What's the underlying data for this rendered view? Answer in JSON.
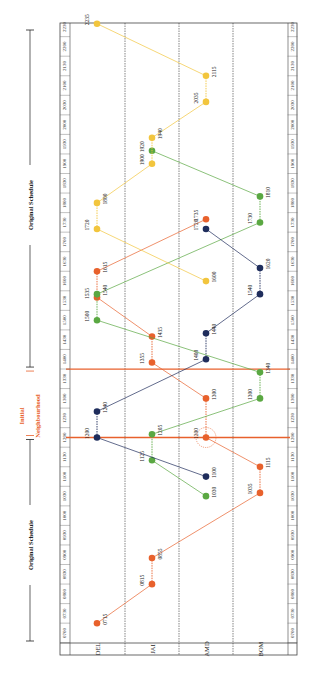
{
  "chart_data": {
    "type": "line",
    "orientation": "rotated 90° counter-clockwise; time axis runs bottom (0700) to top (2230)",
    "time_ticks": [
      "0700",
      "0730",
      "0800",
      "0830",
      "0900",
      "0930",
      "1000",
      "1030",
      "1100",
      "1130",
      "1200",
      "1230",
      "1300",
      "1330",
      "1400",
      "1430",
      "1500",
      "1530",
      "1600",
      "1630",
      "1700",
      "1730",
      "1800",
      "1830",
      "1900",
      "1930",
      "2000",
      "2030",
      "2100",
      "2130",
      "2200",
      "2230"
    ],
    "stations": [
      "DEL",
      "JAI",
      "AMD",
      "BOM"
    ],
    "annotations": {
      "original_schedule_top": "Original Schedule",
      "original_schedule_bottom": "Original Schedule",
      "neighbourhood_line1": "Initial",
      "neighbourhood_line2": "Neighbourhood",
      "neighbourhood_range": [
        "1200",
        "1345"
      ],
      "highlight_circle_at": {
        "station": "AMD",
        "time": "1200"
      }
    },
    "series": [
      {
        "name": "Train 1 (red, DEL→BOM)",
        "color": "#e8612c",
        "points": [
          {
            "station": "DEL",
            "time": "0715",
            "label": "0715"
          },
          {
            "station": "JAI",
            "time": "0815",
            "label": "0815"
          },
          {
            "station": "JAI",
            "time": "0855",
            "label": "0855"
          },
          {
            "station": "BOM",
            "time": "1035",
            "label": "1035"
          },
          {
            "station": "BOM",
            "time": "1115",
            "label": "1115"
          },
          {
            "station": "AMD",
            "time": "1200",
            "label": "1200"
          },
          {
            "station": "AMD",
            "time": "1300",
            "label": "1300"
          },
          {
            "station": "JAI",
            "time": "1355",
            "label": "1355"
          },
          {
            "station": "JAI",
            "time": "1435",
            "label": "1435"
          },
          {
            "station": "DEL",
            "time": "1535",
            "label": "1535"
          },
          {
            "station": "DEL",
            "time": "1615",
            "label": "1615"
          },
          {
            "station": "AMD",
            "time": "1735",
            "label": "1735"
          }
        ]
      },
      {
        "name": "Train 2 (green)",
        "color": "#5aa842",
        "points": [
          {
            "station": "AMD",
            "time": "1030",
            "label": "1030"
          },
          {
            "station": "JAI",
            "time": "1125",
            "label": "1125"
          },
          {
            "station": "JAI",
            "time": "1205",
            "label": "1205"
          },
          {
            "station": "BOM",
            "time": "1300",
            "label": "1300"
          },
          {
            "station": "BOM",
            "time": "1340",
            "label": "1340"
          },
          {
            "station": "DEL",
            "time": "1500",
            "label": "1500"
          },
          {
            "station": "DEL",
            "time": "1540",
            "label": "1540"
          },
          {
            "station": "BOM",
            "time": "1730",
            "label": "1730"
          },
          {
            "station": "BOM",
            "time": "1810",
            "label": "1810"
          },
          {
            "station": "JAI",
            "time": "1920",
            "label": "1920"
          }
        ]
      },
      {
        "name": "Train 3 (navy)",
        "color": "#1f2d5c",
        "points": [
          {
            "station": "AMD",
            "time": "1100",
            "label": "1100"
          },
          {
            "station": "DEL",
            "time": "1200",
            "label": "1200"
          },
          {
            "station": "DEL",
            "time": "1240",
            "label": "1240"
          },
          {
            "station": "AMD",
            "time": "1400",
            "label": "1400"
          },
          {
            "station": "AMD",
            "time": "1440",
            "label": "1440"
          },
          {
            "station": "BOM",
            "time": "1540",
            "label": "1540"
          },
          {
            "station": "BOM",
            "time": "1620",
            "label": "1620"
          },
          {
            "station": "AMD",
            "time": "1720",
            "label": "1720"
          }
        ]
      },
      {
        "name": "Train 4 (yellow)",
        "color": "#f2c53d",
        "points": [
          {
            "station": "AMD",
            "time": "1600",
            "label": "1600"
          },
          {
            "station": "DEL",
            "time": "1720",
            "label": "1720"
          },
          {
            "station": "DEL",
            "time": "1800",
            "label": "1800"
          },
          {
            "station": "JAI",
            "time": "1900",
            "label": "1900"
          },
          {
            "station": "JAI",
            "time": "1940",
            "label": "1940"
          },
          {
            "station": "AMD",
            "time": "2035",
            "label": "2035"
          },
          {
            "station": "AMD",
            "time": "2115",
            "label": "2115"
          },
          {
            "station": "DEL",
            "time": "2235",
            "label": "2235"
          }
        ]
      }
    ],
    "grid": "dashed station separators",
    "legend": "none"
  },
  "labels": {
    "original_top": "Original Schedule",
    "original_bottom": "Original Schedule",
    "neigh1": "Initial",
    "neigh2": "Neighbourhood",
    "stations": [
      "DEL",
      "JAI",
      "AMD",
      "BOM"
    ]
  }
}
